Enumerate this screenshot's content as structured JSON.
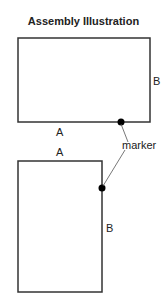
{
  "title": "Assembly Illustration",
  "top_figure": {
    "label_a": "A",
    "label_b": "B",
    "marker_label": "marker"
  },
  "bottom_figure": {
    "label_a": "A",
    "label_b": "B"
  },
  "colors": {
    "line": "#333333",
    "marker": "#000000"
  }
}
